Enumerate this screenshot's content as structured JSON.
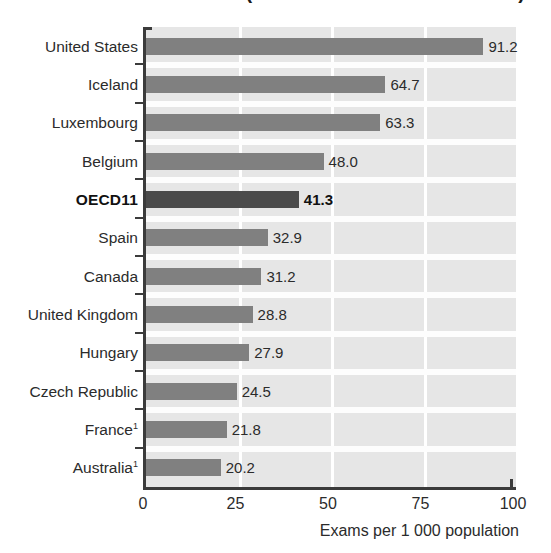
{
  "title": "Number of MRI exams (in the case of the 2002 data)",
  "chart_data": {
    "type": "bar",
    "orientation": "horizontal",
    "title": "Number of MRI exams (in the case of the 2002 data)",
    "title_visible": false,
    "xlabel": "Exams per 1 000 population",
    "ylabel": "",
    "xlim": [
      0,
      100
    ],
    "xticks": [
      "0",
      "25",
      "50",
      "75",
      "100"
    ],
    "xtick_values": [
      0,
      25,
      50,
      75,
      100
    ],
    "grid": "vertical-white",
    "legend": "none",
    "categories": [
      "United States",
      "Iceland",
      "Luxembourg",
      "Belgium",
      "OECD11",
      "Spain",
      "Canada",
      "United Kingdom",
      "Hungary",
      "Czech Republic",
      "France",
      "Australia"
    ],
    "values": [
      91.2,
      64.7,
      63.3,
      48.0,
      41.3,
      32.9,
      31.2,
      28.8,
      27.9,
      24.5,
      21.8,
      20.2
    ],
    "value_labels": [
      "91.2",
      "64.7",
      "63.3",
      "48.0",
      "41.3",
      "32.9",
      "31.2",
      "28.8",
      "27.9",
      "24.5",
      "21.8",
      "20.2"
    ],
    "footnote_markers": [
      "",
      "",
      "",
      "",
      "",
      "",
      "",
      "",
      "",
      "",
      "1",
      "1"
    ],
    "highlight_category": "OECD11",
    "colors": {
      "bar": "#808080",
      "bar_highlight": "#4b4b4b",
      "plot_background": "#e6e6e6",
      "gridline": "#ffffff",
      "axis": "#3b3b3b",
      "text": "#2b2b2b"
    }
  },
  "axis": {
    "x_label": "Exams per 1 000 population",
    "ticks": [
      {
        "label": "0",
        "value": 0
      },
      {
        "label": "25",
        "value": 25
      },
      {
        "label": "50",
        "value": 50
      },
      {
        "label": "75",
        "value": 75
      },
      {
        "label": "100",
        "value": 100
      }
    ]
  },
  "rows": [
    {
      "label": "United States",
      "value_label": "91.2",
      "value": 91.2,
      "footnote": "",
      "highlight": false
    },
    {
      "label": "Iceland",
      "value_label": "64.7",
      "value": 64.7,
      "footnote": "",
      "highlight": false
    },
    {
      "label": "Luxembourg",
      "value_label": "63.3",
      "value": 63.3,
      "footnote": "",
      "highlight": false
    },
    {
      "label": "Belgium",
      "value_label": "48.0",
      "value": 48.0,
      "footnote": "",
      "highlight": false
    },
    {
      "label": "OECD11",
      "value_label": "41.3",
      "value": 41.3,
      "footnote": "",
      "highlight": true
    },
    {
      "label": "Spain",
      "value_label": "32.9",
      "value": 32.9,
      "footnote": "",
      "highlight": false
    },
    {
      "label": "Canada",
      "value_label": "31.2",
      "value": 31.2,
      "footnote": "",
      "highlight": false
    },
    {
      "label": "United Kingdom",
      "value_label": "28.8",
      "value": 28.8,
      "footnote": "",
      "highlight": false
    },
    {
      "label": "Hungary",
      "value_label": "27.9",
      "value": 27.9,
      "footnote": "",
      "highlight": false
    },
    {
      "label": "Czech Republic",
      "value_label": "24.5",
      "value": 24.5,
      "footnote": "",
      "highlight": false
    },
    {
      "label": "France",
      "value_label": "21.8",
      "value": 21.8,
      "footnote": "1",
      "highlight": false
    },
    {
      "label": "Australia",
      "value_label": "20.2",
      "value": 20.2,
      "footnote": "1",
      "highlight": false
    }
  ]
}
